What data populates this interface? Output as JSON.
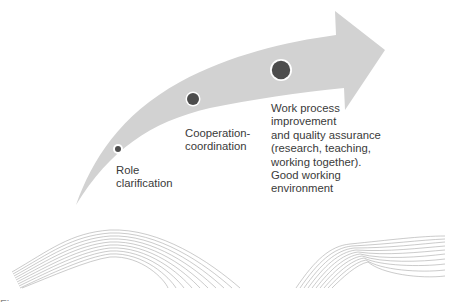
{
  "diagram": {
    "type": "progression-arrow",
    "arrow_color": "#d0d0d0",
    "dot_color": "#4d4d4d",
    "wave_color": "#9a9a9a",
    "stages": [
      {
        "label": "Role\nclarification",
        "dot_size": "small"
      },
      {
        "label": "Cooperation-\ncoordination",
        "dot_size": "medium"
      },
      {
        "label": "Work process\nimprovement\nand quality assurance\n(research, teaching,\nworking together).\nGood working\nenvironment",
        "dot_size": "large"
      }
    ]
  },
  "caption": "Figure"
}
